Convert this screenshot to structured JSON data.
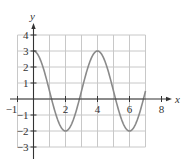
{
  "chart_data": {
    "type": "line",
    "title": "",
    "xlabel": "x",
    "ylabel": "y",
    "xlim": [
      -1,
      8
    ],
    "ylim": [
      -3,
      4
    ],
    "grid": true,
    "grid_x_range": [
      -1,
      7
    ],
    "grid_y_range": [
      -3,
      4
    ],
    "x_ticks": [
      -1,
      2,
      4,
      6,
      8
    ],
    "x_tick_labels": [
      "−1",
      "2",
      "4",
      "6",
      "8"
    ],
    "y_ticks": [
      4,
      3,
      2,
      1,
      -1,
      -2,
      -3
    ],
    "y_tick_labels": [
      "4",
      "3",
      "2",
      "1",
      "−1",
      "−2",
      "−3"
    ],
    "series": [
      {
        "name": "y = 0.5 + 2.5 cos(πx/2)",
        "x": [
          0,
          0.5,
          1,
          1.5,
          2,
          2.5,
          3,
          3.5,
          4,
          4.5,
          5,
          5.5,
          6,
          6.5,
          7
        ],
        "y": [
          3,
          2.27,
          0.5,
          -1.27,
          -2,
          -1.27,
          0.5,
          2.27,
          3,
          2.27,
          0.5,
          -1.27,
          -2,
          -1.27,
          0.5
        ]
      }
    ],
    "key_points": [
      {
        "x": 0,
        "y": 3,
        "label": "maximum"
      },
      {
        "x": 2,
        "y": -2,
        "label": "minimum"
      },
      {
        "x": 4,
        "y": 3,
        "label": "maximum"
      },
      {
        "x": 6,
        "y": -2,
        "label": "minimum"
      }
    ]
  },
  "colors": {
    "axis": "#333333",
    "grid": "#c8c8c8",
    "curve": "#8a8a8a"
  }
}
